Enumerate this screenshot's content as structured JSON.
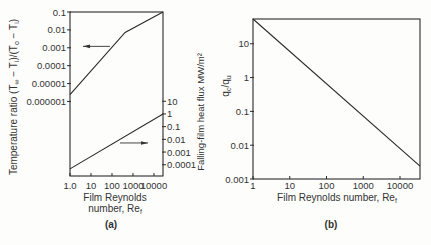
{
  "figure": {
    "panel_a_label": "(a)",
    "panel_b_label": "(b)"
  },
  "chart_data": [
    {
      "id": "a",
      "type": "line",
      "title": "(a)",
      "xlabel": "Film Reynolds number, Re_f",
      "xlabel_lines": [
        "Film Reynolds",
        "number, Re"
      ],
      "xlabel_subscript": "f",
      "x_scale": "log",
      "xlim": [
        1,
        26900
      ],
      "xticks": [
        1,
        10,
        100,
        1000,
        10000
      ],
      "xtick_labels": [
        "1.0",
        "10",
        "100",
        "1000",
        "10000"
      ],
      "y_left": {
        "label": "Temperature ratio (T∞ − Ti)/(To − Ti)",
        "label_parts": [
          {
            "t": "Temperature ratio  (T"
          },
          {
            "t": "∞",
            "sub": true
          },
          {
            "t": " − T"
          },
          {
            "t": "i",
            "sub": true
          },
          {
            "t": ")/(T"
          },
          {
            "t": "o",
            "sub": true
          },
          {
            "t": " − T"
          },
          {
            "t": "i",
            "sub": true
          },
          {
            "t": ")"
          }
        ],
        "scale": "log",
        "ylim": [
          6.8e-11,
          0.1
        ],
        "ticks": [
          0.1,
          0.01,
          0.001,
          0.0001,
          1e-05,
          1e-06
        ],
        "tick_labels": [
          "0.1",
          "0.01",
          "0.001",
          "0.0001",
          "0.00001",
          "0.000001"
        ]
      },
      "y_right": {
        "label": "Falling-film heat flux MW/m²",
        "scale": "log",
        "ylim": [
          1.3e-05,
          107000000.0
        ],
        "ticks": [
          10,
          1,
          0.1,
          0.01,
          0.001,
          0.0001
        ],
        "tick_labels": [
          "10",
          "1",
          "0.1",
          "0.01",
          "0.001",
          "0.0001"
        ]
      },
      "grid": false,
      "legend": null,
      "series": [
        {
          "name": "Temperature ratio",
          "axis": "left",
          "x": [
            1,
            420,
            26900
          ],
          "y": [
            2.4e-06,
            0.0072,
            0.1
          ]
        },
        {
          "name": "Falling-film heat flux",
          "axis": "right",
          "x": [
            1,
            26900
          ],
          "y": [
            4.7e-05,
            1.0
          ]
        }
      ],
      "annotations": [
        {
          "type": "arrow",
          "direction": "left",
          "axis": "left",
          "y": 0.0012,
          "x_from": 80,
          "x_to": 4.2
        },
        {
          "type": "arrow",
          "direction": "right",
          "axis": "right",
          "y": 0.0052,
          "x_from": 240,
          "x_to": 5200
        }
      ]
    },
    {
      "id": "b",
      "type": "line",
      "title": "(b)",
      "xlabel": "Film Reynolds number, Re_f",
      "xlabel_text": "Film Reynolds number, Re",
      "xlabel_subscript": "f",
      "x_scale": "log",
      "xlim": [
        1,
        35000
      ],
      "xticks": [
        1,
        10,
        100,
        1000,
        10000
      ],
      "xtick_labels": [
        "1",
        "10",
        "100",
        "1000",
        "10000"
      ],
      "ylabel": "qc/qu",
      "ylabel_parts": [
        {
          "t": "q"
        },
        {
          "t": "c",
          "sub": true
        },
        {
          "t": "/q"
        },
        {
          "t": "u",
          "sub": true
        }
      ],
      "y_scale": "log",
      "ylim": [
        0.001,
        54
      ],
      "yticks": [
        10,
        1,
        0.1,
        0.01,
        0.001
      ],
      "ytick_labels": [
        "10",
        "1",
        "0.1",
        "0.01",
        "0.001"
      ],
      "grid": false,
      "legend": null,
      "series": [
        {
          "name": "qc/qu",
          "x": [
            1,
            35000
          ],
          "y": [
            54,
            0.0024
          ]
        }
      ]
    }
  ]
}
